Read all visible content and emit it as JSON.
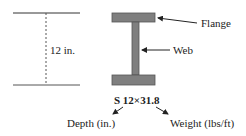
{
  "diagram": {
    "depth_dimension_label": "12 in.",
    "parts": {
      "flange_label": "Flange",
      "web_label": "Web"
    },
    "designation": "S 12×31.8",
    "designation_parts": {
      "depth_label": "Depth (in.)",
      "weight_label": "Weight (lbs/ft)"
    },
    "colors": {
      "beam_fill": "#7f7f7f",
      "beam_stroke": "#555555",
      "line": "#333333"
    }
  }
}
